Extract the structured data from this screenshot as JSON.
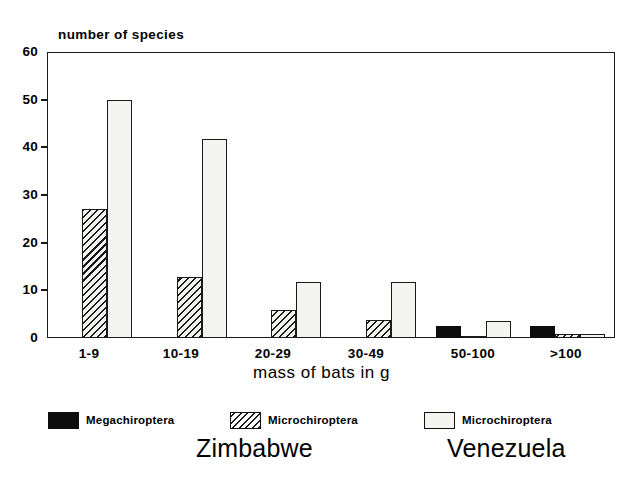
{
  "chart_data": {
    "type": "bar",
    "title": "",
    "ylabel": "number of species",
    "xlabel": "mass of bats in g",
    "ylim": [
      0,
      60
    ],
    "yticks": [
      0,
      10,
      20,
      30,
      40,
      50,
      60
    ],
    "ytick_labels": [
      "0",
      "10",
      "20",
      "30",
      "40",
      "50",
      "60"
    ],
    "grid": false,
    "legend_position": "below-axes",
    "categories": [
      "1-9",
      "10-19",
      "20-29",
      "30-49",
      "50-100",
      ">100"
    ],
    "series": [
      {
        "name": "Megachiroptera",
        "country": "Zimbabwe",
        "fill": "solid-black",
        "color": "#0d0d0d",
        "values": [
          0,
          0,
          0,
          0,
          2.5,
          2.5
        ]
      },
      {
        "name": "Microchiroptera",
        "country": "Zimbabwe",
        "fill": "diagonal-hatch",
        "color": "#1a1a1a",
        "values": [
          27,
          12.8,
          5.8,
          3.8,
          0.3,
          0.9
        ]
      },
      {
        "name": "Microchiroptera",
        "country": "Venezuela",
        "fill": "white",
        "color": "#f4f4f1",
        "values": [
          50,
          41.8,
          11.8,
          11.8,
          3.6,
          0.9
        ]
      }
    ]
  },
  "axis": {
    "y_title": "number of species",
    "x_title": "mass of bats in g",
    "tick_0": "0",
    "tick_10": "10",
    "tick_20": "20",
    "tick_30": "30",
    "tick_40": "40",
    "tick_50": "50",
    "tick_60": "60",
    "cat_0": "1-9",
    "cat_1": "10-19",
    "cat_2": "20-29",
    "cat_3": "30-49",
    "cat_4": "50-100",
    "cat_5": ">100"
  },
  "legend": {
    "items": [
      {
        "label": "Megachiroptera",
        "swatch": "solid-black"
      },
      {
        "label": "Microchiroptera",
        "swatch": "diagonal-hatch"
      },
      {
        "label": "Microchiroptera",
        "swatch": "white-outline"
      }
    ],
    "countries": [
      {
        "label": "Zimbabwe"
      },
      {
        "label": "Venezuela"
      }
    ]
  }
}
